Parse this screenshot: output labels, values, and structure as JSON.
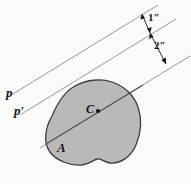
{
  "figure": {
    "type": "engineering-diagram",
    "background_color": "#fafafa",
    "area": {
      "fill_color": "#b9b9b9",
      "stroke_color": "#3c3c3c",
      "label": "A"
    },
    "centroid": {
      "label": "C",
      "marker": "dot",
      "marker_color": "#141414"
    },
    "axes": [
      {
        "id": "p",
        "label": "p",
        "type": "parallel-axis",
        "line_color": "#8a8a99"
      },
      {
        "id": "p-prime",
        "label": "p′",
        "type": "parallel-axis",
        "line_color": "#8a8a99"
      },
      {
        "id": "centroidal",
        "label": "",
        "type": "centroidal-axis",
        "line_color": "#4a4a4a"
      }
    ],
    "dimensions": [
      {
        "id": "dim-1",
        "label": "1″",
        "between": [
          "p",
          "p-prime"
        ],
        "arrow": "double-headed"
      },
      {
        "id": "dim-2",
        "label": "2″",
        "between": [
          "p-prime",
          "centroidal"
        ],
        "arrow": "double-headed"
      }
    ],
    "caption": ""
  }
}
